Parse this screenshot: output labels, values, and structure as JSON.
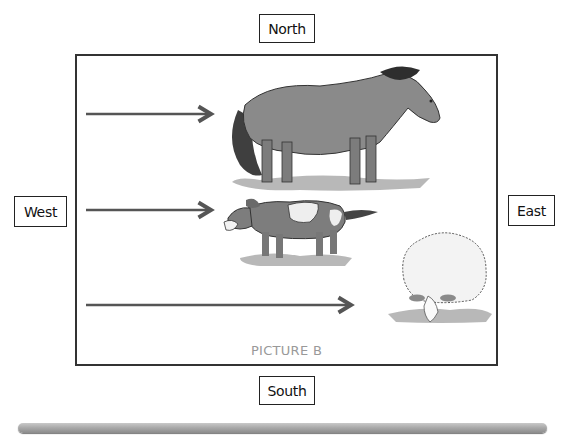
{
  "directions": {
    "north": "North",
    "south": "South",
    "west": "West",
    "east": "East"
  },
  "picture": {
    "caption": "PICTURE B",
    "animals": [
      {
        "name": "horse",
        "facing": "east",
        "arrow": {
          "from_x": 86,
          "to_x": 212,
          "y": 114
        }
      },
      {
        "name": "dog",
        "facing": "west",
        "arrow": {
          "from_x": 86,
          "to_x": 212,
          "y": 210
        }
      },
      {
        "name": "sheep",
        "facing": "south",
        "arrow": {
          "from_x": 86,
          "to_x": 352,
          "y": 305
        }
      }
    ]
  },
  "colors": {
    "arrow": "#555555",
    "frame": "#333333",
    "caption": "#999999",
    "bar": "#a7a7a7"
  }
}
